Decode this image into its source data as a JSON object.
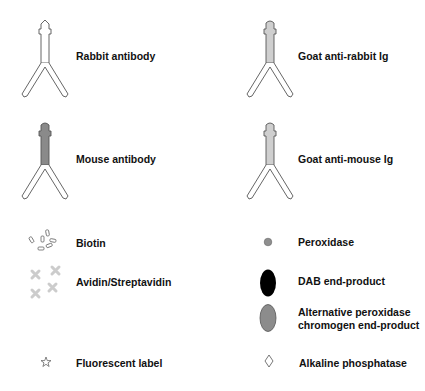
{
  "legend": {
    "antibodies": [
      {
        "label": "Rabbit antibody",
        "fill": "#ffffff"
      },
      {
        "label": "Goat anti-rabbit Ig",
        "fill": "#cfcfcf"
      },
      {
        "label": "Mouse antibody",
        "fill": "#8a8a8a"
      },
      {
        "label": "Goat anti-mouse Ig",
        "fill": "#cfcfcf"
      }
    ],
    "items": [
      {
        "label": "Biotin",
        "icon": "biotin-cluster-icon"
      },
      {
        "label": "Avidin/Streptavidin",
        "icon": "avidin-cross-icon"
      },
      {
        "label": "Fluorescent label",
        "icon": "star-icon"
      },
      {
        "label": "Peroxidase",
        "icon": "small-gray-circle-icon"
      },
      {
        "label": "DAB end-product",
        "icon": "black-ellipse-icon"
      },
      {
        "label": "Alternative peroxidase",
        "label2": "chromogen end-product",
        "icon": "gray-ellipse-icon"
      },
      {
        "label": "Alkaline phosphatase",
        "icon": "diamond-icon"
      }
    ],
    "colors": {
      "outline": "#555555",
      "dab": "#000000",
      "alt_chromogen": "#8c8c8c",
      "peroxidase": "#8f8f8f",
      "avidin": "#cccccc"
    }
  }
}
